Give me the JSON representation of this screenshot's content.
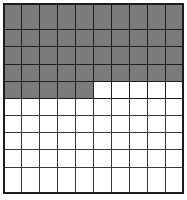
{
  "figure": {
    "name": "shaded-square-grid",
    "type": "grid-fraction-model",
    "columns": 10,
    "rows": 10,
    "total_cells": 100,
    "shaded_cells": 45,
    "unshaded_cells": 55,
    "fraction": "45/100",
    "percent": 45,
    "decimal": 0.45
  },
  "colors": {
    "shaded_fill": "#7b7b7b",
    "unshaded_fill": "#ffffff",
    "grid_line": "#3a3a3a",
    "outer_border": "#1c1c1c",
    "page_background": "#ffffff"
  },
  "chart_data": {
    "type": "heatmap",
    "title": "",
    "xlabel": "",
    "ylabel": "",
    "grid": true,
    "legend": "none",
    "rows": 10,
    "columns": 10,
    "categories": [
      "1",
      "2",
      "3",
      "4",
      "5",
      "6",
      "7",
      "8",
      "9",
      "10"
    ],
    "row_labels": [
      "1",
      "2",
      "3",
      "4",
      "5",
      "6",
      "7",
      "8",
      "9",
      "10"
    ],
    "values": [
      [
        1,
        1,
        1,
        1,
        1,
        1,
        1,
        1,
        1,
        1
      ],
      [
        1,
        1,
        1,
        1,
        1,
        1,
        1,
        1,
        1,
        1
      ],
      [
        1,
        1,
        1,
        1,
        1,
        1,
        1,
        1,
        1,
        1
      ],
      [
        1,
        1,
        1,
        1,
        1,
        1,
        1,
        1,
        1,
        1
      ],
      [
        1,
        1,
        1,
        1,
        1,
        0,
        0,
        0,
        0,
        0
      ],
      [
        0,
        0,
        0,
        0,
        0,
        0,
        0,
        0,
        0,
        0
      ],
      [
        0,
        0,
        0,
        0,
        0,
        0,
        0,
        0,
        0,
        0
      ],
      [
        0,
        0,
        0,
        0,
        0,
        0,
        0,
        0,
        0,
        0
      ],
      [
        0,
        0,
        0,
        0,
        0,
        0,
        0,
        0,
        0,
        0
      ],
      [
        0,
        0,
        0,
        0,
        0,
        0,
        0,
        0,
        0,
        0
      ]
    ],
    "shaded_per_row": [
      10,
      10,
      10,
      10,
      5,
      0,
      0,
      0,
      0,
      0
    ],
    "value_meaning": {
      "1": "shaded",
      "0": "unshaded"
    },
    "annotations": []
  }
}
